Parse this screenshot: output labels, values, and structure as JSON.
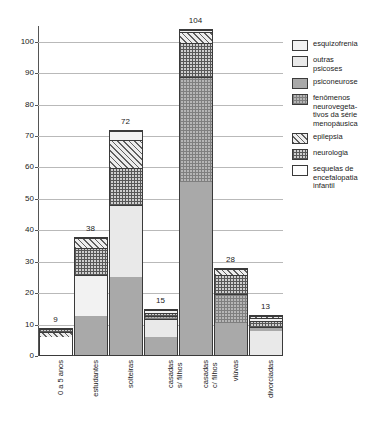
{
  "chart_data": {
    "type": "bar",
    "stacked": true,
    "title": "",
    "xlabel": "",
    "ylabel": "",
    "ylim": [
      0,
      105
    ],
    "yticks": [
      0,
      10,
      20,
      30,
      40,
      50,
      60,
      70,
      80,
      90,
      100
    ],
    "grid": true,
    "legend_position": "right",
    "categories": [
      "0 a 5 anos",
      "estudantes",
      "solteiras",
      "casadas s/ filhos",
      "casadas c/ filhos",
      "viúvas",
      "divorciadas"
    ],
    "category_lines": [
      [
        "0 a 5 anos"
      ],
      [
        "estudantes"
      ],
      [
        "solteiras"
      ],
      [
        "casadas",
        "s/ filhos"
      ],
      [
        "casadas",
        "c/ filhos"
      ],
      [
        "viúvas"
      ],
      [
        "divorciadas"
      ]
    ],
    "totals": [
      9,
      38,
      72,
      15,
      104,
      28,
      13
    ],
    "series": [
      {
        "name": "esquizofrenia",
        "key": "esquizofrenia",
        "pattern": "p-esquizofrenia",
        "values": [
          0,
          13.5,
          3,
          1,
          0.5,
          0,
          1
        ]
      },
      {
        "name": "outras psicoses",
        "key": "outras",
        "pattern": "p-outras",
        "values": [
          0,
          0,
          23,
          6,
          0,
          0,
          8
        ]
      },
      {
        "name": "psiconeurose",
        "key": "psiconeurose",
        "pattern": "p-psiconeurose",
        "values": [
          0,
          12.5,
          25,
          6,
          55.5,
          10.5,
          1.5
        ]
      },
      {
        "name": "fenômenos neurovegetativos da série menopáusica",
        "key": "fenomenos",
        "pattern": "p-fenomenos",
        "values": [
          0,
          0,
          0,
          1,
          33.5,
          9.5,
          0
        ]
      },
      {
        "name": "epilepsia",
        "key": "epilepsia",
        "pattern": "p-epilepsia",
        "values": [
          2,
          3.5,
          9,
          0,
          3.5,
          2,
          0.5
        ]
      },
      {
        "name": "neurologia",
        "key": "neurologia",
        "pattern": "p-neurologia",
        "values": [
          1,
          8.5,
          12,
          1,
          11,
          6,
          2
        ]
      },
      {
        "name": "sequelas de encefalopatia infantil",
        "key": "sequelas",
        "pattern": "p-sequelas",
        "values": [
          6,
          0,
          0,
          0,
          0,
          0,
          0
        ]
      }
    ],
    "stack_order_bottom_to_top": [
      "sequelas",
      "outras",
      "psiconeurose",
      "fenomenos",
      "esquizofrenia",
      "neurologia",
      "epilepsia"
    ],
    "bars": [
      {
        "category": "0 a 5 anos",
        "total": 9,
        "segments": [
          {
            "key": "sequelas",
            "value": 6
          },
          {
            "key": "epilepsia",
            "value": 2
          },
          {
            "key": "neurologia",
            "value": 1
          }
        ]
      },
      {
        "category": "estudantes",
        "total": 38,
        "segments": [
          {
            "key": "psiconeurose",
            "value": 12.5
          },
          {
            "key": "esquizofrenia",
            "value": 13.5
          },
          {
            "key": "neurologia",
            "value": 8.5
          },
          {
            "key": "epilepsia",
            "value": 3.5
          }
        ]
      },
      {
        "category": "solteiras",
        "total": 72,
        "segments": [
          {
            "key": "psiconeurose",
            "value": 25
          },
          {
            "key": "outras",
            "value": 23
          },
          {
            "key": "neurologia",
            "value": 12
          },
          {
            "key": "epilepsia",
            "value": 9
          },
          {
            "key": "esquizofrenia",
            "value": 3
          }
        ]
      },
      {
        "category": "casadas s/ filhos",
        "total": 15,
        "segments": [
          {
            "key": "psiconeurose",
            "value": 6
          },
          {
            "key": "outras",
            "value": 6
          },
          {
            "key": "fenomenos",
            "value": 1
          },
          {
            "key": "neurologia",
            "value": 1
          },
          {
            "key": "esquizofrenia",
            "value": 1
          }
        ]
      },
      {
        "category": "casadas c/ filhos",
        "total": 104,
        "segments": [
          {
            "key": "psiconeurose",
            "value": 55.5
          },
          {
            "key": "fenomenos",
            "value": 33.5
          },
          {
            "key": "neurologia",
            "value": 11
          },
          {
            "key": "epilepsia",
            "value": 3.5
          },
          {
            "key": "esquizofrenia",
            "value": 0.5
          }
        ]
      },
      {
        "category": "viúvas",
        "total": 28,
        "segments": [
          {
            "key": "psiconeurose",
            "value": 10.5
          },
          {
            "key": "fenomenos",
            "value": 9.5
          },
          {
            "key": "neurologia",
            "value": 6
          },
          {
            "key": "epilepsia",
            "value": 2
          }
        ]
      },
      {
        "category": "divorciadas",
        "total": 13,
        "segments": [
          {
            "key": "outras",
            "value": 8
          },
          {
            "key": "psiconeurose",
            "value": 1.5
          },
          {
            "key": "neurologia",
            "value": 2
          },
          {
            "key": "esquizofrenia",
            "value": 1
          },
          {
            "key": "epilepsia",
            "value": 0.5
          }
        ]
      }
    ]
  },
  "legend": {
    "items": [
      {
        "label": "esquizofrenia",
        "key": "esquizofrenia",
        "pattern": "p-esquizofrenia",
        "lines": [
          "esquizofrenia"
        ]
      },
      {
        "label": "outras psicoses",
        "key": "outras",
        "pattern": "p-outras",
        "lines": [
          "outras",
          "psicoses"
        ]
      },
      {
        "label": "psiconeurose",
        "key": "psiconeurose",
        "pattern": "p-psiconeurose",
        "lines": [
          "psiconeurose"
        ]
      },
      {
        "label": "fenômenos neurovegeta-tivos da série menopáusica",
        "key": "fenomenos",
        "pattern": "p-fenomenos",
        "lines": [
          "fenômenos",
          "neurovegeta-",
          "tivos da série",
          "menopáusica"
        ]
      },
      {
        "label": "epilepsia",
        "key": "epilepsia",
        "pattern": "p-epilepsia",
        "lines": [
          "epilepsia"
        ]
      },
      {
        "label": "neurologia",
        "key": "neurologia",
        "pattern": "p-neurologia",
        "lines": [
          "neurologia"
        ]
      },
      {
        "label": "sequelas de encefalopatia infantil",
        "key": "sequelas",
        "pattern": "p-sequelas",
        "lines": [
          "sequelas de",
          "encefalopatia",
          "infantil"
        ]
      }
    ]
  },
  "colors": {
    "axis": "#555555",
    "grid": "#b9b9b9",
    "text": "#222222",
    "background": "#ffffff"
  }
}
